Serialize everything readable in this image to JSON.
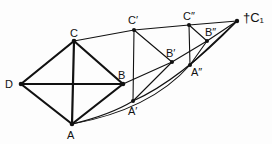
{
  "diagram": {
    "type": "geometric-construction",
    "points": [
      {
        "id": "D",
        "label": "D",
        "x": 21,
        "y": 84,
        "lx": 5,
        "ly": 79
      },
      {
        "id": "C",
        "label": "C",
        "x": 74,
        "y": 41,
        "lx": 70,
        "ly": 28
      },
      {
        "id": "B",
        "label": "B",
        "x": 123,
        "y": 84,
        "lx": 118,
        "ly": 71
      },
      {
        "id": "A",
        "label": "A",
        "x": 72,
        "y": 124,
        "lx": 67,
        "ly": 130
      },
      {
        "id": "C1p",
        "label": "C′",
        "x": 134,
        "y": 30,
        "lx": 127,
        "ly": 15
      },
      {
        "id": "A1p",
        "label": "A′",
        "x": 133,
        "y": 101,
        "lx": 128,
        "ly": 107
      },
      {
        "id": "B1p",
        "label": "B′",
        "x": 172,
        "y": 62,
        "lx": 167,
        "ly": 48
      },
      {
        "id": "C2p",
        "label": "C″",
        "x": 189,
        "y": 25,
        "lx": 183,
        "ly": 11
      },
      {
        "id": "A2p",
        "label": "A″",
        "x": 190,
        "y": 65,
        "lx": 191,
        "ly": 68
      },
      {
        "id": "B2p",
        "label": "B″",
        "x": 207,
        "y": 41,
        "lx": 204,
        "ly": 27
      },
      {
        "id": "C1",
        "label": "†C₁",
        "x": 237,
        "y": 21,
        "lx": 243,
        "ly": 11
      }
    ]
  }
}
